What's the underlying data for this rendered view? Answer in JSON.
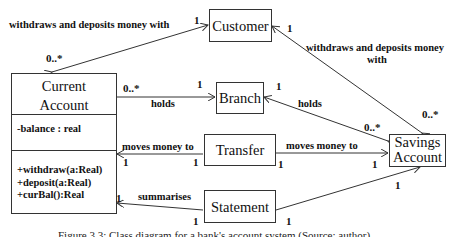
{
  "classes": {
    "customer": {
      "name": "Customer"
    },
    "current_account": {
      "name_line1": "Current",
      "name_line2": "Account",
      "attributes": [
        "-balance : real"
      ],
      "operations": [
        "+withdraw(a:Real)",
        "+deposit(a:Real)",
        "+curBal():Real"
      ]
    },
    "branch": {
      "name": "Branch"
    },
    "transfer": {
      "name": "Transfer"
    },
    "statement": {
      "name": "Statement"
    },
    "savings_account": {
      "name_line1": "Savings",
      "name_line2": "Account"
    }
  },
  "associations": {
    "current_customer": {
      "label": "withdraws and deposits money with",
      "mult_current": "0..*",
      "mult_customer": "1"
    },
    "savings_customer": {
      "label_line1": "withdraws and deposits money",
      "label_line2": "with",
      "mult_customer": "1",
      "mult_savings": "0..*"
    },
    "current_branch": {
      "label": "holds",
      "mult_current": "0..*",
      "mult_branch": "1"
    },
    "savings_branch": {
      "label": "holds",
      "mult_branch": "1",
      "mult_savings": "0..*"
    },
    "transfer_current": {
      "label": "moves money to",
      "mult_current": "1",
      "mult_transfer": "1"
    },
    "transfer_savings": {
      "label": "moves money to",
      "mult_transfer": "1",
      "mult_savings": "1"
    },
    "statement_current": {
      "label": "summarises",
      "mult_current": "1",
      "mult_statement": "1"
    },
    "statement_savings": {
      "mult_statement": "1",
      "mult_savings": "1"
    }
  },
  "caption": "Figure 3.3: Class diagram for a bank's account system (Source: author)"
}
